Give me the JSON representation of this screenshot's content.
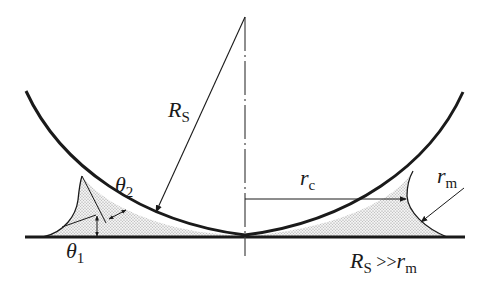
{
  "figure": {
    "labels": {
      "sphere_radius": {
        "main": "R",
        "sub": "S"
      },
      "contact_angle_sphere": {
        "main": "θ",
        "sub": "2"
      },
      "contact_angle_substrate": {
        "main": "θ",
        "sub": "1"
      },
      "neck_radius": {
        "main": "r",
        "sub": "c"
      },
      "meniscus_radius": {
        "main": "r",
        "sub": "m"
      },
      "condition": {
        "main1": "R",
        "sub1": "S",
        "rel": " >>",
        "main2": "r",
        "sub2": "m"
      }
    },
    "colors": {
      "stroke": "#1a1a1a",
      "fill_hatch": "#9a9a9a",
      "background": "#ffffff"
    }
  }
}
